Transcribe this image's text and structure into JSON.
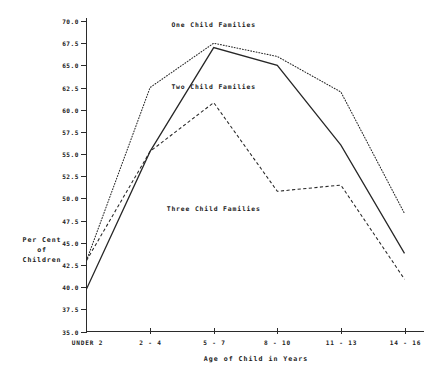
{
  "chart_data": {
    "type": "line",
    "title": "",
    "xlabel": "Age of Child in Years",
    "ylabel": "Per Cent of Children",
    "ylabel_lines": [
      "Per Cent",
      "of",
      "Children"
    ],
    "categories": [
      "UNDER 2",
      "2 - 4",
      "5 - 7",
      "8 - 10",
      "11 - 13",
      "14 - 16"
    ],
    "ylim": [
      35.0,
      70.0
    ],
    "yticks": [
      "70.0",
      "67.5",
      "65.0",
      "62.5",
      "60.0",
      "57.5",
      "55.0",
      "52.5",
      "50.0",
      "47.5",
      "45.0",
      "42.5",
      "40.0",
      "37.5",
      "35.0"
    ],
    "ytick_values": [
      70.0,
      67.5,
      65.0,
      62.5,
      60.0,
      57.5,
      55.0,
      52.5,
      50.0,
      47.5,
      45.0,
      42.5,
      40.0,
      37.5,
      35.0
    ],
    "grid": false,
    "legend_position": "inline-annotations",
    "series": [
      {
        "name": "One Child Families",
        "style": "dotted",
        "values": [
          43.0,
          62.5,
          67.5,
          66.0,
          62.0,
          48.3
        ],
        "label_x_category": "5 - 7",
        "label_value": 69.3
      },
      {
        "name": "Two Child Families",
        "style": "solid",
        "values": [
          39.8,
          55.3,
          67.0,
          65.0,
          56.0,
          43.8
        ],
        "label_x_category": "5 - 7",
        "label_value": 62.3
      },
      {
        "name": "Three Child Families",
        "style": "dashed",
        "values": [
          43.0,
          55.3,
          60.8,
          50.8,
          51.5,
          40.9
        ],
        "label_x_category": "5 - 7",
        "label_value": 48.6
      }
    ]
  },
  "axes": {
    "x_axis_name": "age-axis",
    "y_axis_name": "percent-axis"
  }
}
